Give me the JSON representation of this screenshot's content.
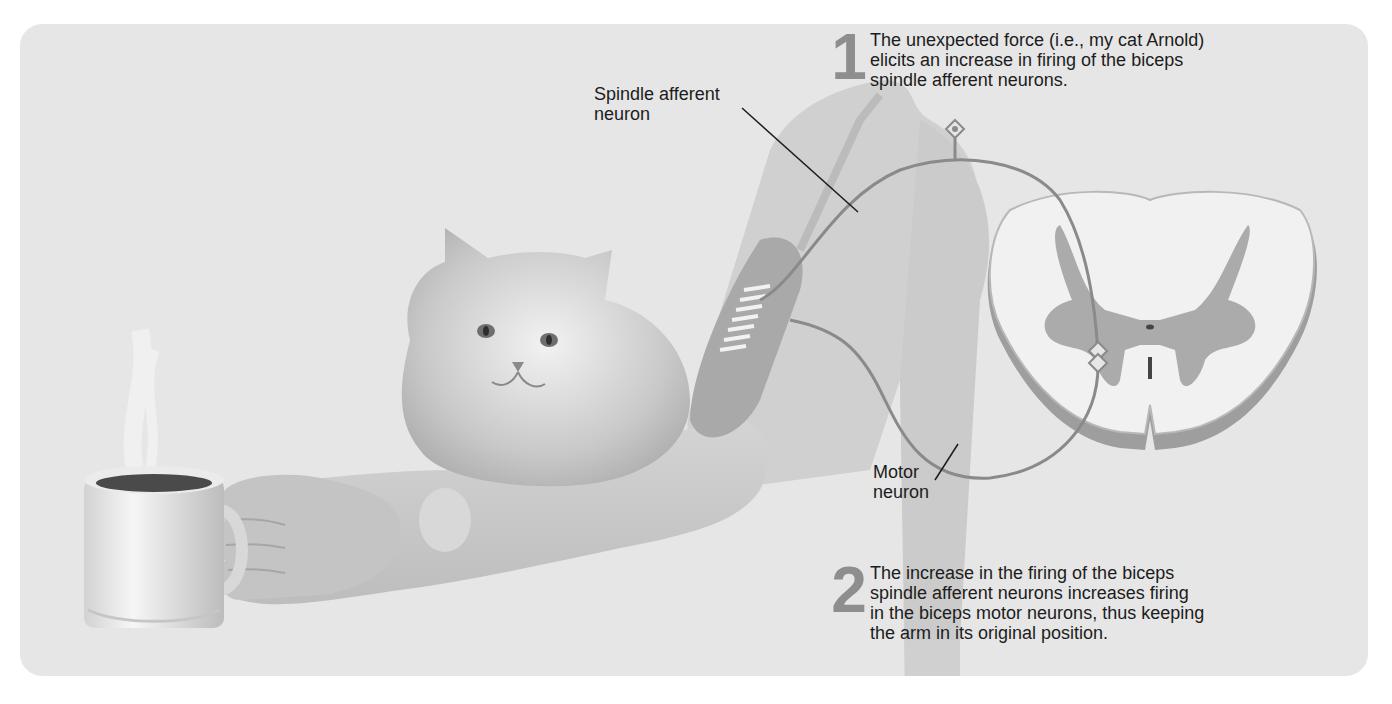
{
  "figure": {
    "labels": {
      "spindle_afferent": "Spindle afferent\nneuron",
      "motor_neuron": "Motor\nneuron"
    },
    "steps": [
      {
        "number": "1",
        "text": "The unexpected force (i.e., my cat Arnold)\nelicits an increase in firing of the biceps\nspindle afferent neurons."
      },
      {
        "number": "2",
        "text": "The increase in the firing of the biceps\nspindle afferent neurons increases firing\nin the biceps motor neurons, thus keeping\nthe arm in its original position."
      }
    ],
    "illustration_elements": [
      "coffee-mug",
      "hand",
      "forearm",
      "cat",
      "upper-arm-biceps",
      "muscle-spindle",
      "spinal-cord-cross-section",
      "synapse-markers"
    ],
    "colors": {
      "panel_bg": "#e6e6e6",
      "neuron_line": "#8a8a8a",
      "gray_matter": "#a9a9a9",
      "white_matter": "#f1f1f1",
      "text": "#1c1c1c",
      "step_number": "#8e8e8e"
    }
  }
}
